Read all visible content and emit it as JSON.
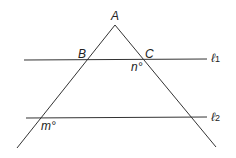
{
  "diagram": {
    "points": {
      "A": "A",
      "B": "B",
      "C": "C"
    },
    "angles": {
      "n": "n°",
      "m": "m°"
    },
    "lines": {
      "l1": {
        "symbol": "ℓ",
        "sub": "1"
      },
      "l2": {
        "symbol": "ℓ",
        "sub": "2"
      }
    },
    "stroke_color": "#333333"
  }
}
